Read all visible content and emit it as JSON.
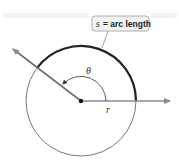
{
  "diagram": {
    "callout": {
      "variable": "s",
      "text": "= arc length"
    },
    "angle_label": "θ",
    "radius_label": "r",
    "colors": {
      "circle": "#555555",
      "arc": "#222222",
      "ray": "#8a8a8a",
      "callout_fill": "#f2f2f2",
      "callout_border": "#999999"
    }
  }
}
